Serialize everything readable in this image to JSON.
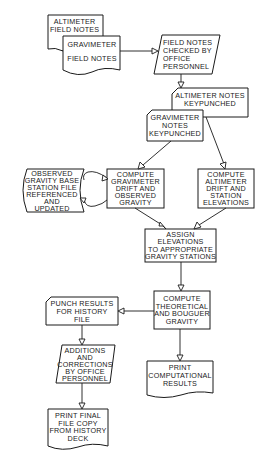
{
  "nodes": {
    "altimeter_field_notes": {
      "shape": "document",
      "label": "ALTIMETER\nFIELD NOTES"
    },
    "gravimeter_field_notes": {
      "shape": "document",
      "label": "GRAVIMETER\n\nFIELD NOTES"
    },
    "field_notes_checked": {
      "shape": "manual-input",
      "label": "FIELD NOTES\nCHECKED BY\nOFFICE\nPERSONNEL"
    },
    "altimeter_keypunched": {
      "shape": "punched-card",
      "label": "ALTIMETER NOTES\nKEYPUNCHED"
    },
    "gravimeter_keypunched": {
      "shape": "punched-card",
      "label": "GRAVIMETER\nNOTES\nKEYPUNCHED"
    },
    "base_station_file": {
      "shape": "stored-data",
      "label": "OBSERVED\nGRAVITY BASE\nSTATION FILE\nREFERENCED\nAND\nUPDATED"
    },
    "compute_gravimeter_drift": {
      "shape": "process",
      "label": "COMPUTE\nGRAVIMETER\nDRIFT AND\nOBSERVED\nGRAVITY"
    },
    "compute_altimeter_drift": {
      "shape": "process",
      "label": "COMPUTE\nALTIMETER\nDRIFT AND\nSTATION\nELEVATIONS"
    },
    "assign_elevations": {
      "shape": "process",
      "label": "ASSIGN\nELEVATIONS\nTO APPROPRIATE\nGRAVITY STATIONS"
    },
    "compute_theoretical": {
      "shape": "process",
      "label": "COMPUTE\nTHEORETICAL\nAND BOUGUER\nGRAVITY"
    },
    "punch_results": {
      "shape": "punched-card",
      "label": "PUNCH RESULTS\nFOR HISTORY\nFILE"
    },
    "additions_corrections": {
      "shape": "manual-input",
      "label": "ADDITIONS\nAND\nCORRECTIONS\nBY OFFICE\nPERSONNEL"
    },
    "print_final": {
      "shape": "document",
      "label": "PRINT FINAL\nFILE COPY\nFROM HISTORY\nDECK"
    },
    "print_computational": {
      "shape": "document",
      "label": "PRINT\nCOMPUTATIONAL\nRESULTS"
    }
  },
  "edges": [
    {
      "from": "gravimeter_field_notes",
      "to": "field_notes_checked"
    },
    {
      "from": "field_notes_checked",
      "to": "altimeter_keypunched"
    },
    {
      "from": "gravimeter_keypunched",
      "to": "compute_gravimeter_drift"
    },
    {
      "from": "altimeter_keypunched",
      "to": "compute_altimeter_drift"
    },
    {
      "from": "compute_gravimeter_drift",
      "to": "base_station_file"
    },
    {
      "from": "base_station_file",
      "to": "compute_gravimeter_drift"
    },
    {
      "from": "compute_gravimeter_drift",
      "to": "assign_elevations"
    },
    {
      "from": "compute_altimeter_drift",
      "to": "assign_elevations"
    },
    {
      "from": "assign_elevations",
      "to": "compute_theoretical"
    },
    {
      "from": "compute_theoretical",
      "to": "punch_results"
    },
    {
      "from": "compute_theoretical",
      "to": "print_computational"
    },
    {
      "from": "punch_results",
      "to": "additions_corrections"
    },
    {
      "from": "additions_corrections",
      "to": "print_final"
    }
  ]
}
